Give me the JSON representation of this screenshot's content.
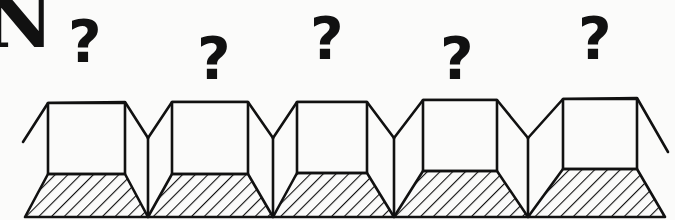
{
  "header": {
    "letter": "N"
  },
  "keys": [
    {
      "symbol": "?",
      "x": 68,
      "y": 13
    },
    {
      "symbol": "?",
      "x": 197,
      "y": 30
    },
    {
      "symbol": "?",
      "x": 310,
      "y": 10
    },
    {
      "symbol": "?",
      "x": 440,
      "y": 30
    },
    {
      "symbol": "?",
      "x": 578,
      "y": 10
    }
  ],
  "colors": {
    "ink": "#111111",
    "paper": "#fbfbfa"
  }
}
